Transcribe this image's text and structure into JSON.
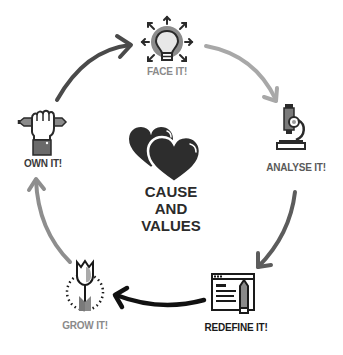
{
  "diagram": {
    "center": {
      "lines": [
        "CAUSE",
        "AND",
        "VALUES"
      ],
      "icon": "two-hearts-icon"
    },
    "steps": [
      {
        "label": "FACE IT!",
        "icon": "lightbulb-icon",
        "color": "#8a8a8a"
      },
      {
        "label": "ANALYSE IT!",
        "icon": "microscope-icon",
        "color": "#5a5a5a"
      },
      {
        "label": "REDEFINE IT!",
        "icon": "document-pencil-icon",
        "color": "#1a1a1a"
      },
      {
        "label": "GROW IT!",
        "icon": "tulip-icon",
        "color": "#8a8a8a"
      },
      {
        "label": "OWN IT!",
        "icon": "hand-holding-pencil-icon",
        "color": "#3a3a3a"
      }
    ],
    "arrows": [
      {
        "from": "OWN IT!",
        "to": "FACE IT!",
        "color": "#4a4a4a"
      },
      {
        "from": "FACE IT!",
        "to": "ANALYSE IT!",
        "color": "#a8a8a8"
      },
      {
        "from": "ANALYSE IT!",
        "to": "REDEFINE IT!",
        "color": "#5c5c5c"
      },
      {
        "from": "REDEFINE IT!",
        "to": "GROW IT!",
        "color": "#111111"
      },
      {
        "from": "GROW IT!",
        "to": "OWN IT!",
        "color": "#8e8e8e"
      }
    ]
  }
}
